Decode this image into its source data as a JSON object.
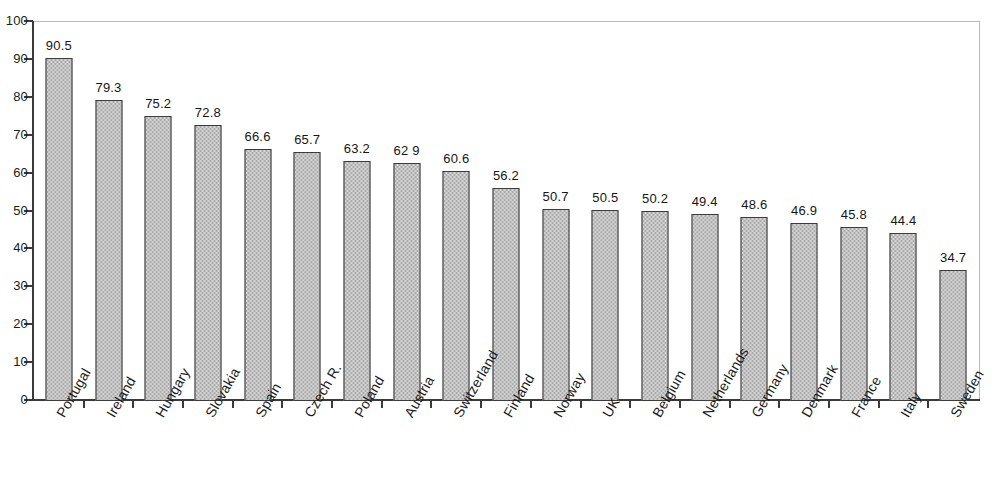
{
  "chart_data": {
    "type": "bar",
    "title": "",
    "subtitle": "",
    "xlabel": "",
    "ylabel": "",
    "ylim": [
      0,
      100
    ],
    "yticks": [
      0,
      10,
      20,
      30,
      40,
      50,
      60,
      70,
      80,
      90,
      100
    ],
    "ytick_labels": [
      "0",
      "10",
      "20",
      "30",
      "40",
      "50",
      "60",
      "70",
      "80",
      "90",
      "100"
    ],
    "grid": false,
    "legend": false,
    "legend_position": "none",
    "categories": [
      "Portugal",
      "Ireland",
      "Hungary",
      "Slovakia",
      "Spain",
      "Czech R.",
      "Poland",
      "Austria",
      "Switzerland",
      "Finland",
      "Norway",
      "UK",
      "Belgium",
      "Netherlands",
      "Germany",
      "Denmark",
      "France",
      "Italy",
      "Sweden"
    ],
    "values": [
      90.5,
      79.3,
      75.2,
      72.8,
      66.6,
      65.7,
      63.2,
      62.9,
      60.6,
      56.2,
      50.7,
      50.5,
      50.2,
      49.4,
      48.6,
      46.9,
      45.8,
      44.4,
      34.7
    ],
    "value_labels": [
      "90.5",
      "79.3",
      "75.2",
      "72.8",
      "66.6",
      "65.7",
      "63.2",
      "62 9",
      "60.6",
      "56.2",
      "50.7",
      "50.5",
      "50.2",
      "49.4",
      "48.6",
      "46.9",
      "45.8",
      "44.4",
      "34.7"
    ],
    "bar_color": "#a9a9a9",
    "bar_edge_color": "#3c3c3c",
    "axis_color": "#3a3a3a",
    "frame_color": "#b9b9b9",
    "text_color": "#1b1b1b"
  }
}
